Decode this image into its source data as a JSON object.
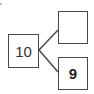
{
  "diagram": {
    "type": "number-bond",
    "whole": {
      "value": "10"
    },
    "parts": [
      {
        "position": "top",
        "value": ""
      },
      {
        "position": "bottom",
        "value": "9"
      }
    ],
    "colors": {
      "stroke": "#4a4a4a",
      "text": "#333333",
      "background": "#ffffff"
    }
  }
}
